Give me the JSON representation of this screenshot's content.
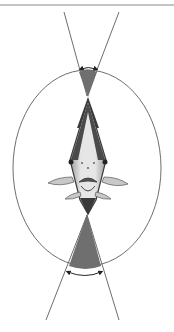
{
  "figure": {
    "width": 174,
    "height": 332,
    "colors": {
      "background": "#ffffff",
      "line": "#6e6e6e",
      "wedge_fill": "#6f6f6f",
      "fish_body": "#d9d9d9",
      "fish_outline": "#3a3a3a",
      "arrow": "#222222"
    },
    "top_rule": {
      "x1": 0,
      "y1": 5,
      "x2": 174,
      "y2": 5
    },
    "ellipse": {
      "cx": 87,
      "cy": 168,
      "rx": 74,
      "ry": 98
    },
    "upper_lines": [
      {
        "x1": 64,
        "y1": 12,
        "x2": 87,
        "y2": 96
      },
      {
        "x1": 119,
        "y1": 12,
        "x2": 87,
        "y2": 96
      }
    ],
    "lower_lines": [
      {
        "x1": 87,
        "y1": 215,
        "x2": 46,
        "y2": 320
      },
      {
        "x1": 87,
        "y1": 215,
        "x2": 119,
        "y2": 320
      }
    ],
    "upper_wedge": {
      "apex": [
        88,
        97
      ],
      "left": [
        79,
        70
      ],
      "right": [
        97,
        70
      ]
    },
    "lower_wedge": {
      "apex": [
        87,
        214
      ],
      "left": [
        69,
        268
      ],
      "right": [
        101,
        268
      ]
    },
    "upper_arrow": {
      "x1": 80,
      "x2": 97,
      "y": 69
    },
    "lower_arrow": {
      "x1": 67,
      "x2": 102,
      "y": 273
    }
  }
}
